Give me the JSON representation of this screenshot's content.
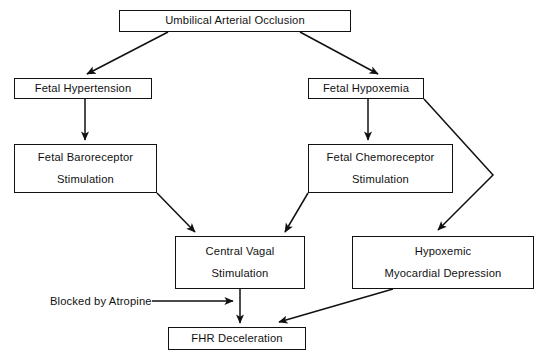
{
  "diagram": {
    "background_color": "#ffffff",
    "line_color": "#111111",
    "nodes": [
      {
        "id": "umbilical_arterial_occlusion",
        "line1": "Umbilical Arterial Occlusion",
        "line2": ""
      },
      {
        "id": "fetal_hypertension",
        "line1": "Fetal Hypertension",
        "line2": ""
      },
      {
        "id": "fetal_hypoxemia",
        "line1": "Fetal Hypoxemia",
        "line2": ""
      },
      {
        "id": "fetal_baroreceptor_stimulation",
        "line1": "Fetal Baroreceptor",
        "line2": "Stimulation"
      },
      {
        "id": "fetal_chemoreceptor_stimulation",
        "line1": "Fetal Chemoreceptor",
        "line2": "Stimulation"
      },
      {
        "id": "central_vagal_stimulation",
        "line1": "Central Vagal",
        "line2": "Stimulation"
      },
      {
        "id": "hypoxemic_myocardial_depression",
        "line1": "Hypoxemic",
        "line2": "Myocardial Depression"
      },
      {
        "id": "fhr_deceleration",
        "line1": "FHR Deceleration",
        "line2": ""
      }
    ],
    "annotations": [
      {
        "id": "blocked_by_atropine",
        "text": "Blocked by Atropine"
      }
    ]
  }
}
